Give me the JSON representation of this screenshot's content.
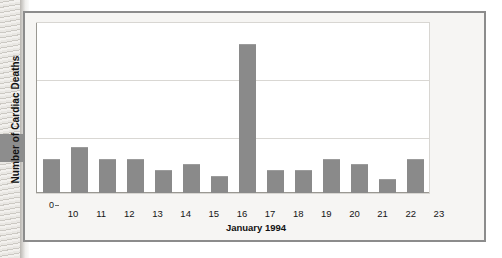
{
  "figure": {
    "frame_color": "#8c8c8c",
    "background_color": "#f6f5f3",
    "bar_color": "#8a8a8a"
  },
  "annotation": {
    "pointer_icon": "arrow-right-pointer",
    "pointer_color": "#8d8d8d"
  },
  "chart_data": {
    "type": "bar",
    "title": "",
    "xlabel": "January 1994",
    "ylabel": "Number of Cardiac Deaths",
    "categories": [
      "10",
      "11",
      "12",
      "13",
      "14",
      "15",
      "16",
      "17",
      "18",
      "19",
      "20",
      "21",
      "22",
      "23"
    ],
    "values": [
      6,
      8,
      6,
      6,
      4,
      5,
      3,
      26,
      4,
      4,
      6,
      5,
      2.5,
      6
    ],
    "ylim": [
      0,
      30
    ],
    "yticks": [
      0,
      10,
      20,
      30
    ],
    "ytick_labels": [
      "0",
      "10",
      "20",
      "30"
    ],
    "grid": true,
    "legend": "none",
    "series": [
      {
        "name": "Cardiac deaths per day",
        "values": [
          6,
          8,
          6,
          6,
          4,
          5,
          3,
          26,
          4,
          4,
          6,
          5,
          2.5,
          6
        ]
      }
    ]
  }
}
